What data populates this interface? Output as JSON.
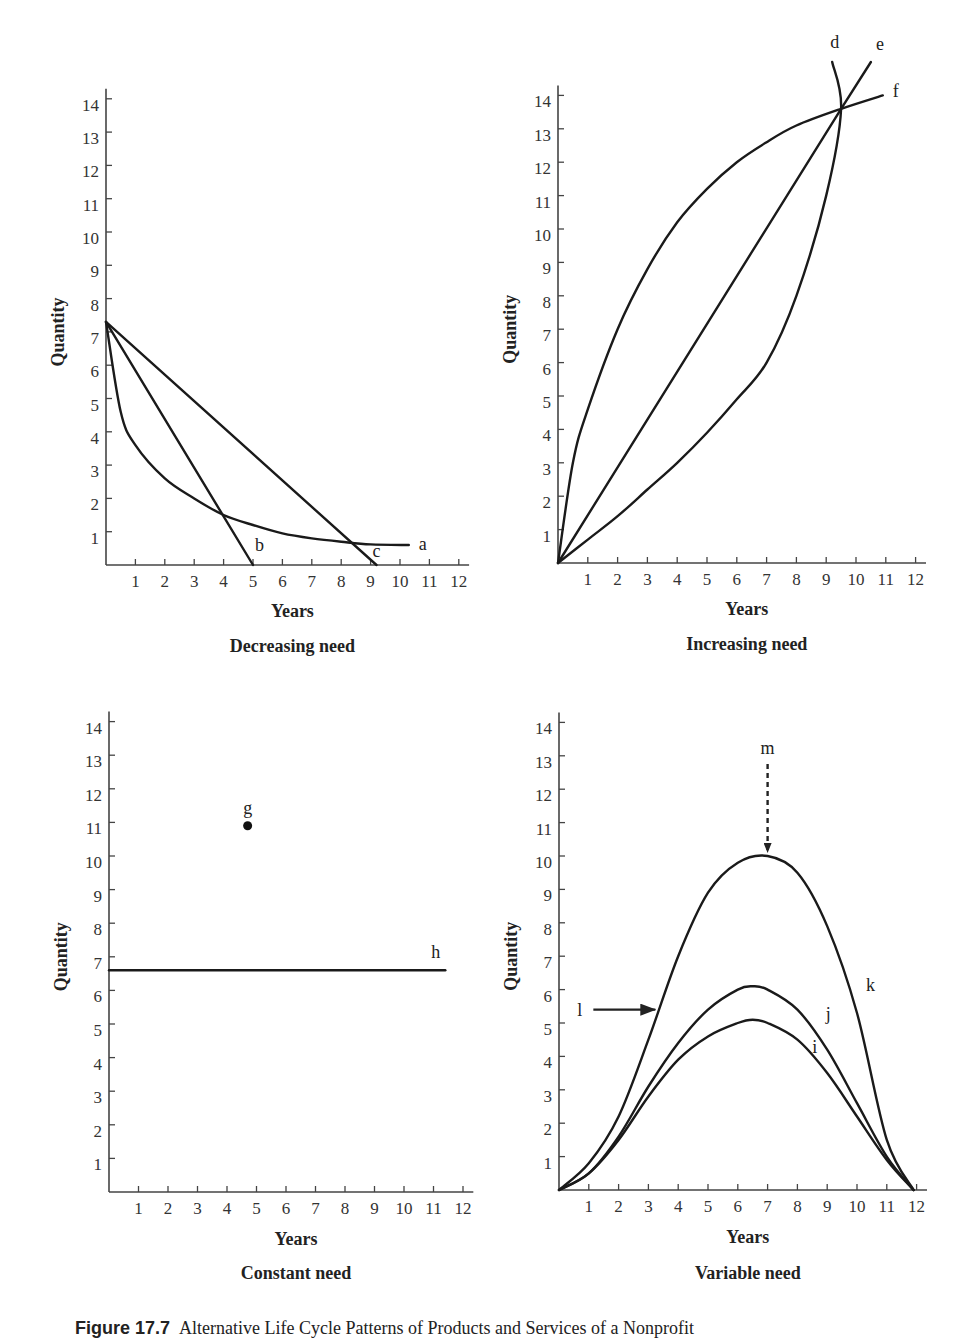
{
  "caption": {
    "figure_number": "Figure 17.7",
    "text": "Alternative Life Cycle Patterns of Products and Services of a Nonprofit"
  },
  "chart_data": [
    {
      "type": "line",
      "title": "Decreasing need",
      "xlabel": "Years",
      "ylabel": "Quantity",
      "xlim": [
        0,
        12
      ],
      "ylim": [
        0,
        14
      ],
      "xticks": [
        "1",
        "2",
        "3",
        "4",
        "5",
        "6",
        "7",
        "8",
        "9",
        "10",
        "11",
        "12"
      ],
      "yticks": [
        "1",
        "2",
        "3",
        "4",
        "5",
        "6",
        "7",
        "8",
        "9",
        "10",
        "11",
        "12",
        "13",
        "14"
      ],
      "grid": false,
      "series": [
        {
          "name": "a",
          "shape": "convex decay",
          "x": [
            0,
            0.5,
            1,
            2,
            3,
            4,
            5,
            6,
            7,
            8,
            9,
            10.3
          ],
          "y": [
            7.3,
            4.6,
            3.6,
            2.6,
            2.0,
            1.5,
            1.2,
            0.95,
            0.8,
            0.7,
            0.62,
            0.6
          ]
        },
        {
          "name": "b",
          "shape": "linear",
          "x": [
            0,
            5.0
          ],
          "y": [
            7.3,
            0
          ]
        },
        {
          "name": "c",
          "shape": "linear",
          "x": [
            0,
            9.2
          ],
          "y": [
            7.3,
            0
          ]
        }
      ]
    },
    {
      "type": "line",
      "title": "Increasing need",
      "xlabel": "Years",
      "ylabel": "Quantity",
      "xlim": [
        0,
        12
      ],
      "ylim": [
        0,
        14
      ],
      "xticks": [
        "1",
        "2",
        "3",
        "4",
        "5",
        "6",
        "7",
        "8",
        "9",
        "10",
        "11",
        "12"
      ],
      "yticks": [
        "1",
        "2",
        "3",
        "4",
        "5",
        "6",
        "7",
        "8",
        "9",
        "10",
        "11",
        "12",
        "13",
        "14"
      ],
      "grid": false,
      "series": [
        {
          "name": "d",
          "shape": "convex growth",
          "x": [
            0,
            1,
            2,
            3,
            4,
            5,
            6,
            7,
            8,
            9,
            9.5,
            9.2
          ],
          "y": [
            0,
            0.7,
            1.4,
            2.2,
            3.0,
            3.9,
            4.9,
            6.0,
            8.0,
            11.0,
            13.6,
            15.0
          ]
        },
        {
          "name": "e",
          "shape": "linear",
          "x": [
            0,
            9.5,
            10.5
          ],
          "y": [
            0,
            13.6,
            15.0
          ]
        },
        {
          "name": "f",
          "shape": "concave growth",
          "x": [
            0,
            0.5,
            1,
            2,
            3,
            4,
            5,
            6,
            7,
            8,
            9.5,
            10.9
          ],
          "y": [
            0,
            3.0,
            4.6,
            7.0,
            8.8,
            10.2,
            11.2,
            12.0,
            12.6,
            13.1,
            13.6,
            14.0
          ]
        }
      ]
    },
    {
      "type": "scatter",
      "title": "Constant need",
      "xlabel": "Years",
      "ylabel": "Quantity",
      "xlim": [
        0,
        12
      ],
      "ylim": [
        0,
        14
      ],
      "xticks": [
        "1",
        "2",
        "3",
        "4",
        "5",
        "6",
        "7",
        "8",
        "9",
        "10",
        "11",
        "12"
      ],
      "yticks": [
        "1",
        "2",
        "3",
        "4",
        "5",
        "6",
        "7",
        "8",
        "9",
        "10",
        "11",
        "12",
        "13",
        "14"
      ],
      "grid": false,
      "series": [
        {
          "name": "g",
          "shape": "point",
          "x": [
            4.7
          ],
          "y": [
            10.9
          ]
        },
        {
          "name": "h",
          "shape": "horizontal line",
          "x": [
            0,
            11.4
          ],
          "y": [
            6.6,
            6.6
          ]
        }
      ]
    },
    {
      "type": "line",
      "title": "Variable need",
      "xlabel": "Years",
      "ylabel": "Quantity",
      "xlim": [
        0,
        12
      ],
      "ylim": [
        0,
        14
      ],
      "xticks": [
        "1",
        "2",
        "3",
        "4",
        "5",
        "6",
        "7",
        "8",
        "9",
        "10",
        "11",
        "12"
      ],
      "yticks": [
        "1",
        "2",
        "3",
        "4",
        "5",
        "6",
        "7",
        "8",
        "9",
        "10",
        "11",
        "12",
        "13",
        "14"
      ],
      "grid": false,
      "series": [
        {
          "name": "i",
          "shape": "bell",
          "x": [
            0,
            1,
            2,
            3,
            4,
            5,
            6,
            6.5,
            7,
            8,
            9,
            10,
            11,
            11.9
          ],
          "y": [
            0,
            0.5,
            1.5,
            2.8,
            3.9,
            4.6,
            5.0,
            5.1,
            5.0,
            4.5,
            3.5,
            2.2,
            0.9,
            0
          ]
        },
        {
          "name": "j",
          "shape": "bell",
          "x": [
            0,
            1,
            2,
            3,
            4,
            5,
            6,
            6.5,
            7,
            8,
            9,
            10,
            11,
            11.9
          ],
          "y": [
            0,
            0.5,
            1.6,
            3.1,
            4.4,
            5.4,
            6.0,
            6.1,
            6.0,
            5.4,
            4.2,
            2.6,
            1.0,
            0
          ]
        },
        {
          "name": "k",
          "shape": "bell",
          "x": [
            0,
            1,
            2,
            3,
            4,
            5,
            6,
            7,
            8,
            9,
            10,
            11,
            11.9
          ],
          "y": [
            0,
            0.8,
            2.2,
            4.5,
            7.0,
            8.9,
            9.8,
            10.0,
            9.5,
            7.9,
            5.3,
            1.5,
            0
          ]
        }
      ],
      "annotations": [
        {
          "label": "l",
          "type": "solid arrow",
          "target_x": 3.3,
          "target_y": 5.4,
          "meaning": "points to growth phase of curve k"
        },
        {
          "label": "m",
          "type": "dashed arrow",
          "target_x": 7.0,
          "target_y": 10.0,
          "meaning": "points to peak of curve k"
        }
      ]
    }
  ],
  "labels": {
    "years": "Years",
    "quantity": "Quantity"
  }
}
